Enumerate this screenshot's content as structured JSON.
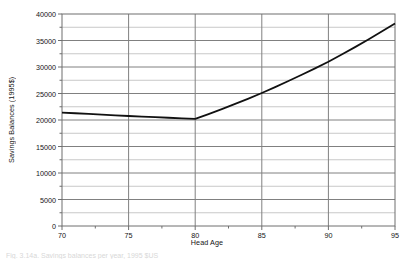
{
  "chart_data": {
    "type": "line",
    "title": "",
    "xlabel": "Head Age",
    "ylabel": "Savings Balances (1995$)",
    "xlim": [
      70,
      95
    ],
    "ylim": [
      0,
      40000
    ],
    "xticks": [
      70,
      75,
      80,
      85,
      90,
      95
    ],
    "xtick_labels": [
      "70",
      "75",
      "80",
      "85",
      "90",
      "95"
    ],
    "yticks": [
      0,
      5000,
      10000,
      15000,
      20000,
      25000,
      30000,
      35000,
      40000
    ],
    "ytick_labels": [
      "0",
      "5000",
      "10000",
      "15000",
      "20000",
      "25000",
      "30000",
      "35000",
      "40000"
    ],
    "y_minor_step": 2500,
    "x_minor_step": 2.5,
    "grid": true,
    "grid_major_color": "#808080",
    "grid_minor_color": "#c8c8c8",
    "legend": null,
    "series": [
      {
        "name": "Savings Balances",
        "color": "#111111",
        "linewidth": 1.8,
        "x": [
          70,
          71,
          72,
          73,
          74,
          75,
          76,
          77,
          78,
          79,
          80,
          81,
          82,
          83,
          84,
          85,
          86,
          87,
          88,
          89,
          90,
          91,
          92,
          93,
          94,
          95
        ],
        "values": [
          21400,
          21270,
          21140,
          21010,
          20880,
          20750,
          20640,
          20530,
          20420,
          20310,
          20200,
          21100,
          22050,
          23050,
          24050,
          25100,
          26200,
          27350,
          28550,
          29750,
          31000,
          32350,
          33750,
          35200,
          36700,
          38200
        ]
      }
    ],
    "annotations": []
  },
  "figure": {
    "caption": "Fig. 3.14a. Savings balances per year, 1995 $US",
    "background": "#ffffff"
  }
}
